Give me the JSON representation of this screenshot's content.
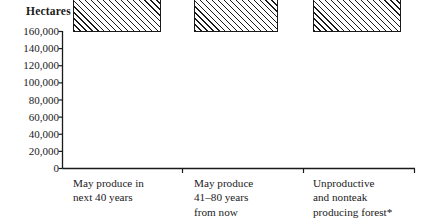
{
  "chart_data": {
    "type": "bar",
    "title": "",
    "ylabel": "Hectares",
    "xlabel": "",
    "categories": [
      "May produce in\nnext 40 years",
      "May produce\n41–80 years\nfrom now",
      "Unproductive\nand nonteak\nproducing forest*"
    ],
    "values": [
      60000,
      158000,
      85000
    ],
    "ylim": [
      0,
      160000
    ],
    "yticks": [
      0,
      20000,
      40000,
      60000,
      80000,
      100000,
      120000,
      140000,
      160000
    ],
    "ytick_labels": [
      "0",
      "20,000",
      "40,000",
      "60,000",
      "80,000",
      "100,000",
      "120,000",
      "140,000",
      "160,000"
    ],
    "grid": false,
    "legend": false,
    "bar_fill": "hatched-diagonal",
    "colors": {
      "axis": "#1a1a1a",
      "bar_outline": "#1a1a1a",
      "bar_hatch": "#1a1a1a",
      "background": "#ffffff"
    }
  },
  "footnote": "*"
}
